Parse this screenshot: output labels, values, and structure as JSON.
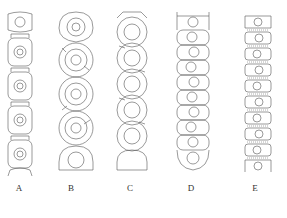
{
  "figure": {
    "type": "illustration",
    "ink_color": "#555555",
    "panels": [
      {
        "label": "A",
        "center_x": 19,
        "width": 28,
        "segments": 6,
        "shape": "barrel-with-joints"
      },
      {
        "label": "B",
        "center_x": 75,
        "width": 34,
        "segments": 6,
        "shape": "round"
      },
      {
        "label": "C",
        "center_x": 131,
        "width": 32,
        "segments": 7,
        "shape": "round-overlapping"
      },
      {
        "label": "D",
        "center_x": 192,
        "width": 33,
        "segments": 10,
        "shape": "rounded-rect"
      },
      {
        "label": "E",
        "center_x": 257,
        "width": 28,
        "segments": 9,
        "shape": "rect-with-striated-joints"
      }
    ]
  }
}
